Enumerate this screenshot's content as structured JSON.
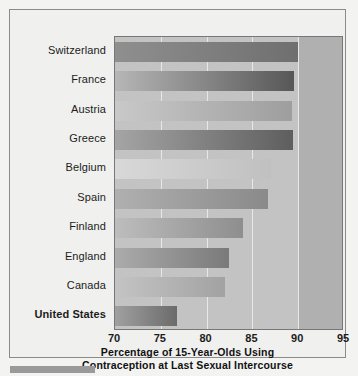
{
  "chart_data": {
    "type": "bar",
    "orientation": "horizontal",
    "title": "",
    "xlabel": "Percentage of 15-Year-Olds Using Contraception at Last Sexual Intercourse",
    "xlabel_lines": [
      "Percentage of 15-Year-Olds Using",
      "Contraception at Last Sexual Intercourse"
    ],
    "ylabel": "",
    "categories": [
      "Switzerland",
      "France",
      "Austria",
      "Greece",
      "Belgium",
      "Spain",
      "Finland",
      "England",
      "Canada",
      "United States"
    ],
    "values": [
      90.0,
      89.5,
      89.3,
      89.4,
      87.0,
      86.7,
      84.0,
      82.4,
      82.0,
      76.8
    ],
    "xlim": [
      70,
      95
    ],
    "xticks": [
      70,
      75,
      80,
      85,
      90,
      95
    ],
    "xtick_labels": [
      "70",
      "75",
      "80",
      "85",
      "90",
      "95"
    ],
    "grid": "vertical-white",
    "legend": null,
    "highlight_category": "United States",
    "bar_gradients": [
      {
        "from": "#8f8f8f",
        "to": "#6f6f6f"
      },
      {
        "from": "#b6b6b6",
        "to": "#575757"
      },
      {
        "from": "#c9c9c9",
        "to": "#9e9e9e"
      },
      {
        "from": "#a5a5a5",
        "to": "#5e5e5e"
      },
      {
        "from": "#d8d8d8",
        "to": "#c0c0c0"
      },
      {
        "from": "#b0b0b0",
        "to": "#8a8a8a"
      },
      {
        "from": "#bdbdbd",
        "to": "#8e8e8e"
      },
      {
        "from": "#ababab",
        "to": "#7a7a7a"
      },
      {
        "from": "#c4c4c4",
        "to": "#a2a2a2"
      },
      {
        "from": "#a0a0a0",
        "to": "#6b6b6b"
      }
    ],
    "colors": {
      "plot_background": "#c3c3c3",
      "right_band": "#b0b0b0",
      "gridline": "#e8e8e6",
      "figure_background": "#f0f0ee",
      "frame_border": "#8b8b8b",
      "text": "#1c1c1c"
    }
  }
}
